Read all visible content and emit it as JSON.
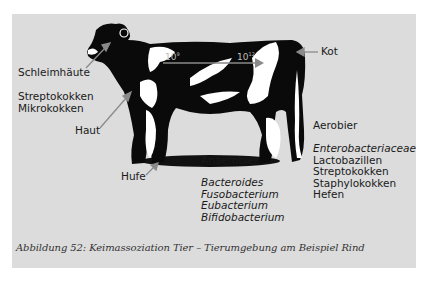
{
  "figure": {
    "caption": "Abbildung 52: Keimassoziation Tier – Tierumgebung am Beispiel Rind",
    "background_color": "#dcdcdc",
    "arrow_color": "#8a8a8a"
  },
  "labels": {
    "schleimhaeute": "Schleimhäute",
    "haut": "Haut",
    "hufe": "Hufe",
    "kot": "Kot",
    "anaerobier": "Anaerobier",
    "aerobier": "Aerobier"
  },
  "gradient": {
    "start_base": "10",
    "start_exp": "9",
    "end_base": "10",
    "end_exp": "12"
  },
  "lists": {
    "skin_organisms": [
      "Streptokokken",
      "Mikrokokken"
    ],
    "anaerobes": [
      "Bacteroides",
      "Fusobacterium",
      "Eubacterium",
      "Bifidobacterium"
    ],
    "aerobes": [
      {
        "name": "Enterobacteriaceae",
        "italic": true
      },
      {
        "name": "Lactobazillen",
        "italic": false
      },
      {
        "name": "Streptokokken",
        "italic": false
      },
      {
        "name": "Staphylokokken",
        "italic": false
      },
      {
        "name": "Hefen",
        "italic": false
      }
    ]
  }
}
